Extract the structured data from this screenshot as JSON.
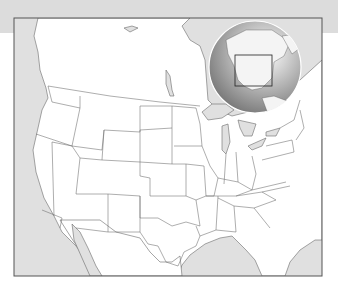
{
  "map": {
    "title": "",
    "region": "Contiguous United States outline map",
    "colors": {
      "banner": "#dcdcdc",
      "water": "#e0e0e0",
      "land": "#ffffff",
      "border": "#6a6a6a",
      "frame": "#555555",
      "foreign_land": "#d6d6d6"
    },
    "frame": {
      "x": 14,
      "y": 18,
      "width": 308,
      "height": 258
    },
    "inset": {
      "type": "globe-locator",
      "center": [
        255,
        67
      ],
      "radius": 46,
      "highlight_box": {
        "x": 235,
        "y": 55,
        "width": 37,
        "height": 31
      }
    }
  }
}
